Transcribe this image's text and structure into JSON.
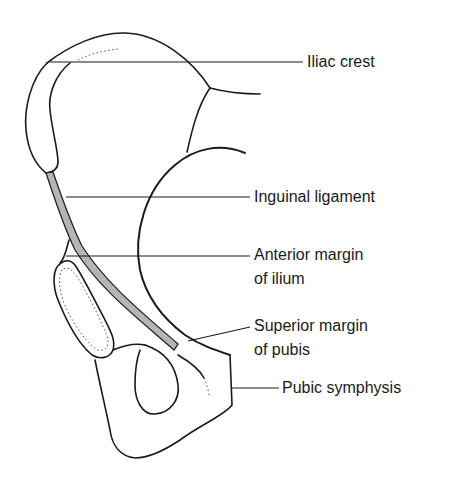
{
  "diagram": {
    "colors": {
      "outline": "#1a1a1a",
      "ligament_fill": "#b5b5b5",
      "background": "#ffffff"
    },
    "labels": [
      {
        "id": "iliac-crest",
        "lines": [
          "Iliac crest"
        ]
      },
      {
        "id": "inguinal-ligament",
        "lines": [
          "Inguinal ligament"
        ]
      },
      {
        "id": "anterior-margin-of-ilium",
        "lines": [
          "Anterior margin",
          "of ilium"
        ]
      },
      {
        "id": "superior-margin-of-pubis",
        "lines": [
          "Superior margin",
          "of pubis"
        ]
      },
      {
        "id": "pubic-symphysis",
        "lines": [
          "Pubic symphysis"
        ]
      }
    ]
  }
}
